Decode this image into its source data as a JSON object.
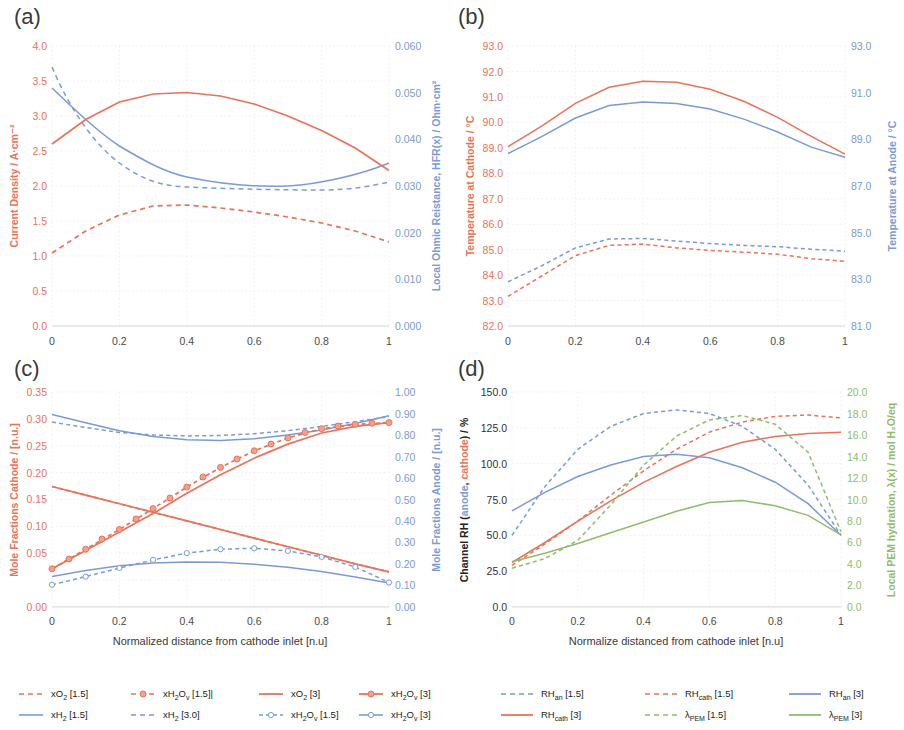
{
  "figure": {
    "panels": [
      "(a)",
      "(b)",
      "(c)",
      "(d)"
    ]
  },
  "panel_a": {
    "letter": "(a)",
    "y_left_title": "Current Density / A·cm⁻²",
    "y_right_title": "Local Ohmic Reistance, HFR(x) / Ohm·cm²",
    "y_left_ticks": [
      "0.0",
      "0.5",
      "1.0",
      "1.5",
      "2.0",
      "2.5",
      "3.0",
      "3.5",
      "4.0"
    ],
    "y_right_ticks": [
      "0.000",
      "0.010",
      "0.020",
      "0.030",
      "0.040",
      "0.050",
      "0.060"
    ],
    "x_ticks": [
      "0",
      "0.2",
      "0.4",
      "0.6",
      "0.8",
      "1"
    ]
  },
  "panel_b": {
    "letter": "(b)",
    "y_left_title": "Temperature at Cathode / °C",
    "y_right_title": "Temperature at Anode / °C",
    "y_left_ticks": [
      "82.0",
      "83.0",
      "84.0",
      "85.0",
      "86.0",
      "87.0",
      "88.0",
      "89.0",
      "90.0",
      "91.0",
      "92.0",
      "93.0"
    ],
    "y_right_ticks": [
      "81.0",
      "83.0",
      "85.0",
      "87.0",
      "89.0",
      "91.0",
      "93.0"
    ],
    "x_ticks": [
      "0",
      "0.2",
      "0.4",
      "0.6",
      "0.8",
      "1"
    ]
  },
  "panel_c": {
    "letter": "(c)",
    "y_left_title": "Mole Fractions Cathode / [n.u.]",
    "y_right_title": "Mole Fractions Anode / [n.u.]",
    "y_left_ticks": [
      "0.00",
      "0.05",
      "0.10",
      "0.15",
      "0.20",
      "0.25",
      "0.30",
      "0.35"
    ],
    "y_right_ticks": [
      "0.00",
      "0.10",
      "0.20",
      "0.30",
      "0.40",
      "0.50",
      "0.60",
      "0.70",
      "0.80",
      "0.90",
      "1.00"
    ],
    "x_ticks": [
      "0",
      "0.2",
      "0.4",
      "0.6",
      "0.8",
      "1"
    ],
    "x_title": "Normalized distance from cathode inlet [n.u]"
  },
  "panel_d": {
    "letter": "(d)",
    "y_left_title_parts": [
      "Channel RH (",
      "anode",
      ", ",
      "cathode",
      ") / %"
    ],
    "y_right_title": "Local PEM hydration, λ(x) / mol H₂O/eq",
    "y_left_ticks": [
      "0.0",
      "25.0",
      "50.0",
      "75.0",
      "100.0",
      "125.0",
      "150.0"
    ],
    "y_right_ticks": [
      "0.0",
      "2.0",
      "4.0",
      "6.0",
      "8.0",
      "10.0",
      "12.0",
      "14.0",
      "16.0",
      "18.0",
      "20.0"
    ],
    "x_ticks": [
      "0",
      "0.2",
      "0.4",
      "0.6",
      "0.8",
      "1"
    ],
    "x_title": "Normalize distanced from cathode inlet [n.u]"
  },
  "legend_left": {
    "row1": [
      {
        "label_html": "xO<sub>2</sub> [1.5]",
        "color": "#E8735A",
        "style": "dashed",
        "marker": false
      },
      {
        "label_html": "xH<sub>2</sub>O<sub>v</sub> [1.5]|",
        "color": "#E8735A",
        "style": "dashed",
        "marker": true
      },
      {
        "label_html": "xO<sub>2</sub> [3]",
        "color": "#E8735A",
        "style": "solid",
        "marker": false
      },
      {
        "label_html": "xH<sub>2</sub>O<sub>v</sub> [3]",
        "color": "#E8735A",
        "style": "solid",
        "marker": true
      }
    ],
    "row2": [
      {
        "label_html": "xH<sub>2</sub> [1.5]",
        "color": "#7B9BD6",
        "style": "solid",
        "marker": false
      },
      {
        "label_html": "xH<sub>2</sub> [3.0]",
        "color": "#7B9BD6",
        "style": "dashed",
        "marker": false
      },
      {
        "label_html": "xH<sub>2</sub>O<sub>v</sub> [1.5]",
        "color": "#7B9BD6",
        "style": "dashed",
        "marker": true
      },
      {
        "label_html": "xH<sub>2</sub>O<sub>v</sub> [3]",
        "color": "#7B9BD6",
        "style": "solid",
        "marker": true
      }
    ]
  },
  "legend_right": {
    "row1": [
      {
        "label_html": "RH<sub>an</sub> [1.5]",
        "color": "#7B9BD6",
        "style": "dashed",
        "marker": false
      },
      {
        "label_html": "RH<sub>cath</sub> [1.5]",
        "color": "#E8735A",
        "style": "dashed",
        "marker": false
      },
      {
        "label_html": "RH<sub>an</sub> [3]",
        "color": "#7B9BD6",
        "style": "solid",
        "marker": false
      }
    ],
    "row2": [
      {
        "label_html": "RH<sub>cath</sub> [3]",
        "color": "#E8735A",
        "style": "solid",
        "marker": false
      },
      {
        "label_html": "λ<sub>PEM</sub> [1.5]",
        "color": "#8FBC6A",
        "style": "dashed",
        "marker": false
      },
      {
        "label_html": "λ<sub>PEM</sub> [3]",
        "color": "#8FBC6A",
        "style": "solid",
        "marker": false
      }
    ]
  },
  "colors": {
    "red": "#E8735A",
    "blue": "#7B9BD6",
    "green": "#8FBC6A",
    "grid": "#e9e9e9",
    "text": "#3a3a3a"
  },
  "chart_data": [
    {
      "type": "line",
      "panel": "(a)",
      "title": "",
      "xlabel": "",
      "ylabel": "Current Density / A·cm^-2",
      "ylabel_right": "Local Ohmic Reistance, HFR(x) / Ohm·cm^2",
      "xlim": [
        0,
        1
      ],
      "ylim": [
        0,
        4
      ],
      "ylim_right": [
        0,
        0.06
      ],
      "grid": true,
      "legend_position": "bottom-left-shared",
      "x": [
        0,
        0.1,
        0.2,
        0.3,
        0.4,
        0.5,
        0.6,
        0.7,
        0.8,
        0.9,
        1.0
      ],
      "series": [
        {
          "name": "Current Density [3]",
          "axis": "left",
          "color": "#E8735A",
          "style": "solid",
          "values": [
            2.6,
            2.95,
            3.2,
            3.31,
            3.33,
            3.28,
            3.17,
            3.0,
            2.79,
            2.53,
            2.23
          ]
        },
        {
          "name": "Current Density [1.5]",
          "axis": "left",
          "color": "#E8735A",
          "style": "dashed",
          "values": [
            1.04,
            1.35,
            1.58,
            1.71,
            1.72,
            1.68,
            1.62,
            1.55,
            1.47,
            1.35,
            1.2
          ]
        },
        {
          "name": "HFR(x) [3]",
          "axis": "right",
          "color": "#7B9BD6",
          "style": "solid",
          "values": [
            0.051,
            0.0481,
            0.0456,
            0.0437,
            0.0424,
            0.0418,
            0.0416,
            0.0417,
            0.0419,
            0.0426,
            0.044
          ]
        },
        {
          "name": "HFR(x) [1.5]",
          "axis": "right",
          "color": "#7B9BD6",
          "style": "dashed",
          "values": [
            0.0568,
            0.0507,
            0.0452,
            0.0415,
            0.0403,
            0.0401,
            0.0401,
            0.0402,
            0.0403,
            0.0407,
            0.0414
          ]
        }
      ]
    },
    {
      "type": "line",
      "panel": "(b)",
      "title": "",
      "xlabel": "",
      "ylabel": "Temperature at Cathode / °C",
      "ylabel_right": "Temperature at Anode / °C",
      "xlim": [
        0,
        1
      ],
      "ylim": [
        82.0,
        93.0
      ],
      "ylim_right": [
        81.0,
        93.0
      ],
      "grid": true,
      "x": [
        0,
        0.1,
        0.2,
        0.3,
        0.4,
        0.5,
        0.6,
        0.7,
        0.8,
        0.9,
        1.0
      ],
      "series": [
        {
          "name": "T cathode [3]",
          "axis": "left",
          "color": "#E8735A",
          "style": "solid",
          "values": [
            89.05,
            89.85,
            90.75,
            91.38,
            91.62,
            91.58,
            91.3,
            90.83,
            90.2,
            89.45,
            88.75
          ]
        },
        {
          "name": "T anode [3]",
          "axis": "right",
          "color": "#7B9BD6",
          "style": "solid",
          "values": [
            88.78,
            89.5,
            90.3,
            90.83,
            90.98,
            90.92,
            90.68,
            90.25,
            89.7,
            89.05,
            88.62
          ]
        },
        {
          "name": "T cathode [1.5]",
          "axis": "left",
          "color": "#E8735A",
          "style": "dashed",
          "values": [
            83.15,
            83.95,
            84.75,
            85.15,
            85.2,
            85.05,
            84.95,
            84.88,
            84.8,
            84.62,
            84.52
          ]
        },
        {
          "name": "T anode [1.5]",
          "axis": "right",
          "color": "#7B9BD6",
          "style": "dashed",
          "values": [
            83.72,
            84.35,
            85.05,
            85.4,
            85.42,
            85.32,
            85.22,
            85.15,
            85.1,
            85.0,
            84.92
          ]
        }
      ]
    },
    {
      "type": "line",
      "panel": "(c)",
      "title": "",
      "xlabel": "Normalized distance from cathode inlet [n.u]",
      "ylabel": "Mole Fractions Cathode / [n.u.]",
      "ylabel_right": "Mole Fractions Anode / [n.u.]",
      "xlim": [
        0,
        1
      ],
      "ylim": [
        0.0,
        0.35
      ],
      "ylim_right": [
        0.0,
        1.0
      ],
      "grid": true,
      "x": [
        0,
        0.1,
        0.2,
        0.3,
        0.4,
        0.5,
        0.6,
        0.7,
        0.8,
        0.9,
        1.0
      ],
      "series": [
        {
          "name": "xO2 [3]",
          "axis": "left",
          "color": "#E8735A",
          "style": "solid",
          "values": [
            0.196,
            0.182,
            0.168,
            0.154,
            0.14,
            0.126,
            0.112,
            0.098,
            0.084,
            0.07,
            0.057
          ]
        },
        {
          "name": "xO2 [1.5]",
          "axis": "left",
          "color": "#E8735A",
          "style": "dashed",
          "values": [
            0.196,
            0.182,
            0.168,
            0.154,
            0.14,
            0.126,
            0.112,
            0.098,
            0.084,
            0.07,
            0.057
          ]
        },
        {
          "name": "xH2Ov [3] cathode",
          "axis": "left",
          "color": "#E8735A",
          "style": "solid",
          "marker": true,
          "values": [
            0.062,
            0.092,
            0.122,
            0.152,
            0.185,
            0.215,
            0.242,
            0.265,
            0.283,
            0.294,
            0.3
          ]
        },
        {
          "name": "xH2Ov [1.5] cathode",
          "axis": "left",
          "color": "#E8735A",
          "style": "dashed",
          "marker": true,
          "values": [
            0.062,
            0.094,
            0.126,
            0.16,
            0.195,
            0.227,
            0.254,
            0.275,
            0.29,
            0.297,
            0.3
          ]
        },
        {
          "name": "xH2 [1.5]",
          "axis": "right",
          "color": "#7B9BD6",
          "style": "solid",
          "values": [
            0.895,
            0.857,
            0.82,
            0.793,
            0.778,
            0.775,
            0.783,
            0.8,
            0.824,
            0.854,
            0.89
          ]
        },
        {
          "name": "xH2 [3.0]",
          "axis": "right",
          "color": "#7B9BD6",
          "style": "dashed",
          "values": [
            0.86,
            0.835,
            0.812,
            0.8,
            0.796,
            0.798,
            0.806,
            0.82,
            0.84,
            0.862,
            0.885
          ]
        },
        {
          "name": "xH2Ov [3] anode",
          "axis": "right",
          "color": "#7B9BD6",
          "style": "solid",
          "marker": true,
          "values": [
            0.14,
            0.168,
            0.19,
            0.203,
            0.208,
            0.206,
            0.197,
            0.183,
            0.163,
            0.138,
            0.11
          ]
        },
        {
          "name": "xH2Ov [1.5] anode",
          "axis": "right",
          "color": "#7B9BD6",
          "style": "dashed",
          "marker": true,
          "values": [
            0.102,
            0.14,
            0.18,
            0.218,
            0.25,
            0.268,
            0.272,
            0.26,
            0.232,
            0.185,
            0.112
          ]
        }
      ]
    },
    {
      "type": "line",
      "panel": "(d)",
      "title": "",
      "xlabel": "Normalize distanced from cathode inlet [n.u]",
      "ylabel": "Channel RH (anode, cathode) / %",
      "ylabel_right": "Local PEM hydration, λ(x) / mol H2O/eq",
      "xlim": [
        0,
        1
      ],
      "ylim": [
        0.0,
        150.0
      ],
      "ylim_right": [
        0.0,
        20.0
      ],
      "grid": true,
      "x": [
        0,
        0.1,
        0.2,
        0.3,
        0.4,
        0.5,
        0.6,
        0.7,
        0.8,
        0.9,
        1.0
      ],
      "series": [
        {
          "name": "RH_an [3]",
          "axis": "left",
          "color": "#7B9BD6",
          "style": "solid",
          "values": [
            67,
            80,
            91,
            99,
            105,
            106.5,
            104,
            97,
            87,
            72,
            50
          ]
        },
        {
          "name": "RH_cath [3]",
          "axis": "left",
          "color": "#E8735A",
          "style": "solid",
          "values": [
            31,
            45,
            60,
            74,
            87,
            98,
            108,
            115,
            119,
            121,
            122
          ]
        },
        {
          "name": "RH_an [1.5]",
          "axis": "left",
          "color": "#7B9BD6",
          "style": "dashed",
          "values": [
            50,
            84,
            110,
            126,
            135,
            137.5,
            135,
            126,
            110,
            85,
            50
          ]
        },
        {
          "name": "RH_cath [1.5]",
          "axis": "left",
          "color": "#E8735A",
          "style": "dashed",
          "values": [
            29,
            44,
            60,
            78,
            95,
            110,
            122,
            129,
            133,
            134,
            132
          ]
        },
        {
          "name": "lambda_PEM [3]",
          "axis": "right",
          "color": "#8FBC6A",
          "style": "solid",
          "values": [
            4.2,
            5.0,
            5.9,
            6.9,
            7.9,
            8.9,
            9.7,
            9.9,
            9.4,
            8.5,
            6.7
          ]
        },
        {
          "name": "lambda_PEM [1.5]",
          "axis": "right",
          "color": "#8FBC6A",
          "style": "dashed",
          "values": [
            3.6,
            4.5,
            6.2,
            9.5,
            13.2,
            15.9,
            17.4,
            17.8,
            17.0,
            14.4,
            7.0
          ]
        }
      ]
    }
  ]
}
